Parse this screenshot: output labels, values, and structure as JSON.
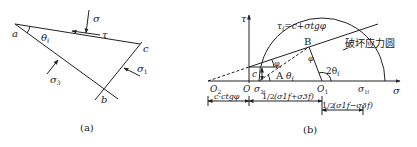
{
  "panel_a": {
    "caption": "(a)",
    "points": {
      "a": "a",
      "b": "b",
      "c": "c"
    },
    "angle": "θ",
    "angle_sub": "f",
    "stress_sigma": "σ",
    "stress_tau": "τ",
    "sigma1": "σ",
    "sigma1_sub": "1",
    "sigma3": "σ",
    "sigma3_sub": "3"
  },
  "panel_b": {
    "caption": "(b)",
    "axis_tau": "τ",
    "axis_sigma": "σ",
    "envelope_eq": "τf=c+σtgφ",
    "envelope_lhs": "τ",
    "envelope_lhs_sub": "f",
    "envelope_rhs": "=c+σtgφ",
    "failure_circle_label": "破坏应力圆",
    "point_B": "B",
    "point_A": "A",
    "origin": "O",
    "O2": "O",
    "O2_sub": "2",
    "O1": "O",
    "O1_sub": "1",
    "c_label": "c",
    "phi": "φ",
    "phi_at_B": "φ",
    "theta_f": "θ",
    "theta_f_sub": "f",
    "two_theta_f": "2θ",
    "two_theta_f_sub": "f",
    "sigma3f": "σ",
    "sigma3f_sub": "3f",
    "sigma1f": "σ",
    "sigma1f_sub": "1f",
    "dim_c_ctg": "c·ctgφ",
    "dim_half_sum_frac": "1/2",
    "dim_half_sum": "(σ1f+σ3f)",
    "dim_half_diff_frac": "1/2",
    "dim_half_diff": "(σ1f−σ3f)"
  }
}
